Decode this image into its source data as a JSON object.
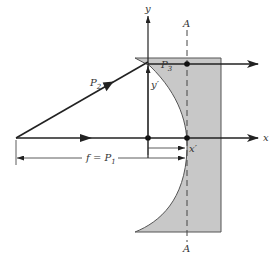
{
  "diagram": {
    "type": "optics-ray-diagram",
    "labels": {
      "x_axis": "x",
      "y_axis": "y",
      "plane_top": "A",
      "plane_bottom": "A",
      "ray_P2": "P",
      "ray_P2_sub": "2",
      "point_P3": "P",
      "point_P3_sub": "3",
      "y_prime": "y′",
      "x_prime": "x′",
      "focal": "f = P",
      "focal_sub": "1"
    },
    "colors": {
      "shade": "#c8c8c8",
      "line": "#222222",
      "background": "#ffffff"
    }
  }
}
